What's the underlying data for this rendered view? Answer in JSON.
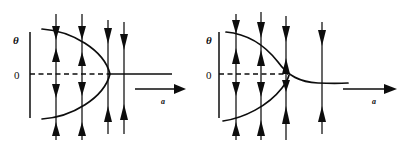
{
  "figure": {
    "type": "phase-portrait-pair",
    "background_color": "#ffffff",
    "ink_color": "#0d0d0d",
    "panels": [
      {
        "id": "left",
        "name": "saddle-node-bifurcation-panel",
        "vertical_axis_label": "θ",
        "origin_label": "0",
        "horizontal_axis_label": "a",
        "curve_description": "leftward-opening parabola (nullcline) with vertex on the right",
        "horizontal_arrow_label": "a",
        "flow_line_count": 4,
        "flow_lines": [
          {
            "x_fraction": 0.17,
            "arrows": [
              "down-top",
              "up-upper",
              "down-lower",
              "up-bottom"
            ]
          },
          {
            "x_fraction": 0.4,
            "arrows": [
              "down-top",
              "up-upper",
              "down-lower",
              "up-bottom"
            ]
          },
          {
            "x_fraction": 0.62,
            "arrows": [
              "down-top",
              "up-bottom"
            ]
          },
          {
            "x_fraction": 0.75,
            "arrows": [
              "down-top",
              "up-bottom"
            ]
          }
        ]
      },
      {
        "id": "right",
        "name": "imperfect-bifurcation-panel",
        "vertical_axis_label": "θ",
        "origin_label": "0",
        "horizontal_axis_label": "a",
        "curve_description": "descending S-shaped nullcline asymptoting below zero, plus lower rising branch meeting it near the axis",
        "horizontal_arrow_label": "a",
        "flow_line_count": 4,
        "flow_lines": [
          {
            "x_fraction": 0.14,
            "arrows": [
              "down-top",
              "up-upper",
              "down-lower",
              "up-bottom"
            ]
          },
          {
            "x_fraction": 0.33,
            "arrows": [
              "down-top",
              "up-upper",
              "down-lower",
              "up-bottom"
            ]
          },
          {
            "x_fraction": 0.47,
            "arrows": [
              "down-top",
              "up-upper",
              "down-lower",
              "up-bottom"
            ]
          },
          {
            "x_fraction": 0.72,
            "arrows": [
              "down-top",
              "up-bottom"
            ]
          }
        ]
      }
    ]
  },
  "left_panel": {
    "theta_label": "θ",
    "zero_label": "0",
    "a_label": "a"
  },
  "right_panel": {
    "theta_label": "θ",
    "zero_label": "0",
    "a_label": "a"
  }
}
